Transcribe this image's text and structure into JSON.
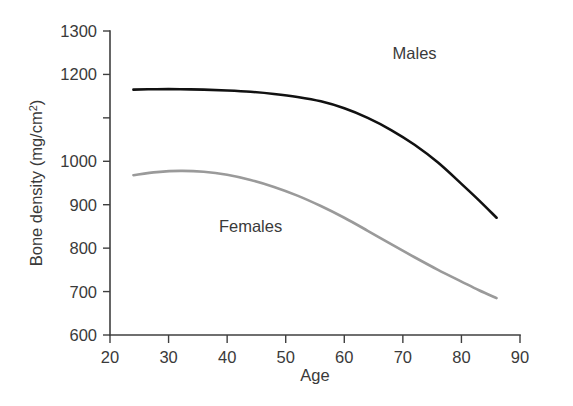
{
  "chart_data": {
    "type": "line",
    "title": "",
    "xlabel": "Age",
    "ylabel": "Bone density (mg/cm",
    "ylabel_sup": "2",
    "ylabel_suffix": ")",
    "xlim": [
      20,
      90
    ],
    "ylim": [
      600,
      1300
    ],
    "grid": false,
    "legend_position": "inline-annotations",
    "xticks": [
      20,
      30,
      40,
      50,
      60,
      70,
      80,
      90
    ],
    "xtick_labels": [
      "20",
      "30",
      "40",
      "50",
      "60",
      "70",
      "80",
      "90"
    ],
    "yticks": [
      600,
      700,
      800,
      900,
      1000,
      1100,
      1200,
      1300
    ],
    "ytick_labels": [
      "600",
      "700",
      "800",
      "900",
      "1000",
      "1200",
      "1300"
    ],
    "ytick_label_values": [
      600,
      700,
      800,
      900,
      1000,
      1200,
      1300
    ],
    "series": [
      {
        "name": "Males",
        "color": "#111111",
        "stroke_width": 2.6,
        "label_x": 72,
        "label_y": 1235,
        "x": [
          24,
          28,
          32,
          36,
          40,
          44,
          48,
          52,
          56,
          60,
          64,
          68,
          72,
          76,
          80,
          83,
          86
        ],
        "values": [
          1165,
          1166,
          1166,
          1165,
          1163,
          1160,
          1155,
          1148,
          1138,
          1122,
          1100,
          1072,
          1038,
          997,
          948,
          910,
          870
        ]
      },
      {
        "name": "Females",
        "color": "#9a9a9a",
        "stroke_width": 2.6,
        "label_x": 44,
        "label_y": 838,
        "x": [
          24,
          28,
          32,
          36,
          40,
          44,
          48,
          52,
          56,
          60,
          64,
          68,
          72,
          76,
          80,
          83,
          86
        ],
        "values": [
          968,
          975,
          978,
          976,
          969,
          957,
          941,
          921,
          897,
          870,
          840,
          809,
          779,
          750,
          723,
          703,
          685
        ]
      }
    ],
    "annotations": [
      {
        "text": "Males",
        "x": 72,
        "y": 1235
      },
      {
        "text": "Females",
        "x": 44,
        "y": 838
      }
    ]
  }
}
